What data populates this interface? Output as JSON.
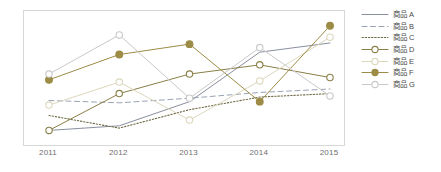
{
  "chart_data": {
    "type": "line",
    "title": "",
    "xlabel": "",
    "ylabel": "",
    "categories": [
      "2011",
      "2012",
      "2013",
      "2014",
      "2015"
    ],
    "x": [
      2011,
      2012,
      2013,
      2014,
      2015
    ],
    "grid": false,
    "legend_position": "right",
    "ylim": [
      0,
      100
    ],
    "axis_ticks_visible": false,
    "series": [
      {
        "name": "商品 A",
        "label": "商品 A",
        "color": "#8a8f9e",
        "style": "solid",
        "marker": "none",
        "values": [
          4,
          8,
          29,
          72,
          80
        ]
      },
      {
        "name": "商品 B",
        "label": "商品 B",
        "color": "#9aa3b4",
        "style": "dashed",
        "marker": "none",
        "values": [
          30,
          28,
          32,
          37,
          40
        ]
      },
      {
        "name": "商品 C",
        "label": "商品 C",
        "color": "#6f6a45",
        "style": "dotted",
        "marker": "none",
        "values": [
          17,
          6,
          22,
          33,
          36
        ]
      },
      {
        "name": "商品 D",
        "label": "商品 D",
        "color": "#8a7f47",
        "style": "solid",
        "marker": "circle-open",
        "values": [
          4,
          36,
          53,
          61,
          50
        ]
      },
      {
        "name": "商品 E",
        "label": "商品 E",
        "color": "#ddd7bd",
        "style": "solid",
        "marker": "circle-open",
        "values": [
          26,
          46,
          13,
          47,
          85
        ]
      },
      {
        "name": "商品 F",
        "label": "商品 F",
        "color": "#9c8c45",
        "style": "solid",
        "marker": "circle-filled",
        "values": [
          48,
          70,
          79,
          29,
          95
        ]
      },
      {
        "name": "商品 G",
        "label": "商品 G",
        "color": "#c9c9c9",
        "style": "solid",
        "marker": "circle-open",
        "values": [
          53,
          87,
          32,
          76,
          34
        ]
      }
    ]
  },
  "legend": {
    "items": [
      {
        "label": "商品 A"
      },
      {
        "label": "商品 B"
      },
      {
        "label": "商品 C"
      },
      {
        "label": "商品 D"
      },
      {
        "label": "商品 E"
      },
      {
        "label": "商品 F"
      },
      {
        "label": "商品 G"
      }
    ]
  },
  "axis": {
    "x_ticks": [
      "2011",
      "2012",
      "2013",
      "2014",
      "2015"
    ]
  },
  "colors": {
    "frame_border": "#d8d8d8",
    "background": "#ffffff",
    "tick_text": "#6e6e6e",
    "legend_text": "#4a4a4a"
  }
}
